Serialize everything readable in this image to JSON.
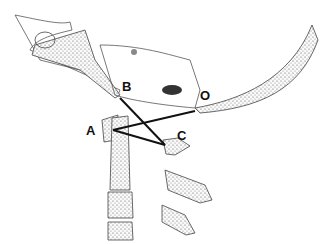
{
  "figure": {
    "labels": {
      "a": "A",
      "b": "B",
      "c": "C",
      "o": "O"
    },
    "points": {
      "A": [
        113,
        130
      ],
      "B": [
        120,
        98
      ],
      "C": [
        165,
        145
      ],
      "O": [
        195,
        111
      ]
    },
    "lines": [
      [
        "B",
        "C"
      ],
      [
        "A",
        "O"
      ],
      [
        "A",
        "C"
      ]
    ],
    "colors": {
      "line": "#111111",
      "bone_fill": "#e8e8e8",
      "stroke": "#444444"
    }
  }
}
